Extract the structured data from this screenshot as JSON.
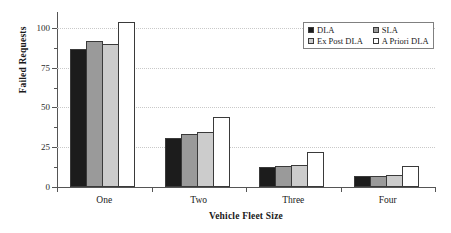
{
  "chart_data": {
    "type": "bar",
    "title": "",
    "xlabel": "Vehicle Fleet Size",
    "ylabel": "Failed Requests",
    "categories": [
      "One",
      "Two",
      "Three",
      "Four"
    ],
    "series": [
      {
        "name": "DLA",
        "color": "#1c1c1c",
        "values": [
          87,
          31,
          12.5,
          7
        ]
      },
      {
        "name": "SLA",
        "color": "#9a9a9a",
        "values": [
          92,
          33.5,
          13.5,
          7
        ]
      },
      {
        "name": "Ex Post DLA",
        "color": "#cccccc",
        "values": [
          90,
          34.5,
          14,
          7.5
        ]
      },
      {
        "name": "A Priori DLA",
        "color": "#ffffff",
        "values": [
          104,
          44,
          22,
          13
        ]
      }
    ],
    "ylim": [
      0,
      110
    ],
    "yticks": [
      0,
      25,
      50,
      75,
      100
    ],
    "ytick_labels": [
      "0",
      "25",
      "50",
      "75",
      "100"
    ],
    "yminor_ticks": [
      12.5,
      37.5,
      62.5,
      87.5
    ],
    "grid": true,
    "legend_position": "upper right"
  },
  "legend": {
    "items": [
      {
        "label": "DLA"
      },
      {
        "label": "SLA"
      },
      {
        "label": "Ex Post DLA"
      },
      {
        "label": "A Priori DLA"
      }
    ]
  }
}
